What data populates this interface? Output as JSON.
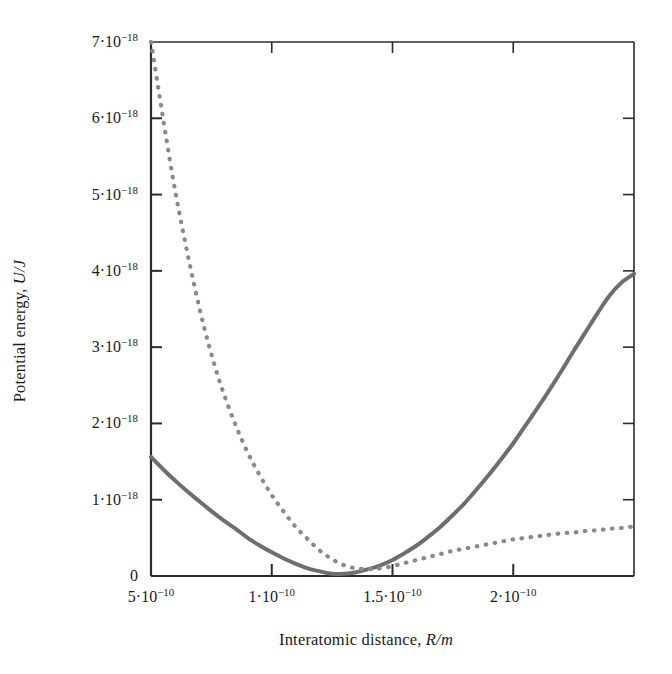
{
  "chart_data": {
    "type": "line",
    "title": "",
    "xlabel": "Interatomic distance, R/m",
    "xlabel_plain": "Interatomic distance,",
    "xlabel_italic": "R/m",
    "ylabel": "Potential energy, U/J",
    "ylabel_plain": "Potential energy,",
    "ylabel_italic": "U/J",
    "xlim": [
      5e-11,
      2.5e-10
    ],
    "ylim": [
      0,
      7e-18
    ],
    "grid": false,
    "legend": "none",
    "x_ticks": [
      {
        "value": 5e-11,
        "mantissa": "5",
        "exponent": "-10",
        "label": "5 · 10⁻¹⁰"
      },
      {
        "value": 1e-10,
        "mantissa": "1",
        "exponent": "-10",
        "label": "1 · 10⁻¹⁰"
      },
      {
        "value": 1.5e-10,
        "mantissa": "1.5",
        "exponent": "-10",
        "label": "1.5 · 10⁻¹⁰"
      },
      {
        "value": 2e-10,
        "mantissa": "2",
        "exponent": "-10",
        "label": "2 · 10⁻¹⁰"
      }
    ],
    "y_ticks": [
      {
        "value": 0,
        "mantissa": "0",
        "exponent": "",
        "label": "0"
      },
      {
        "value": 1e-18,
        "mantissa": "1",
        "exponent": "-18",
        "label": "1 · 10⁻¹⁸"
      },
      {
        "value": 2e-18,
        "mantissa": "2",
        "exponent": "-18",
        "label": "2 · 10⁻¹⁸"
      },
      {
        "value": 3e-18,
        "mantissa": "3",
        "exponent": "-18",
        "label": "3 · 10⁻¹⁸"
      },
      {
        "value": 4e-18,
        "mantissa": "4",
        "exponent": "-18",
        "label": "4 · 10⁻¹⁸"
      },
      {
        "value": 5e-18,
        "mantissa": "5",
        "exponent": "-18",
        "label": "5 · 10⁻¹⁸"
      },
      {
        "value": 6e-18,
        "mantissa": "6",
        "exponent": "-18",
        "label": "6 · 10⁻¹⁸"
      },
      {
        "value": 7e-18,
        "mantissa": "7",
        "exponent": "-18",
        "label": "7 · 10⁻¹⁸"
      }
    ],
    "series": [
      {
        "name": "solid-curve",
        "style": "solid",
        "color": "#6e6e6e",
        "x": [
          0.5,
          0.55,
          0.6,
          0.65,
          0.7,
          0.75,
          0.8,
          0.85,
          0.9,
          0.95,
          1.0,
          1.05,
          1.1,
          1.15,
          1.2,
          1.25,
          1.3,
          1.35,
          1.4,
          1.45,
          1.5,
          1.55,
          1.6,
          1.65,
          1.7,
          1.75,
          1.8,
          1.85,
          1.9,
          1.95,
          2.0,
          2.05,
          2.1,
          2.15,
          2.2,
          2.25,
          2.3,
          2.35,
          2.4,
          2.45,
          2.5
        ],
        "x_unit": "1e-10 m",
        "y": [
          1.56,
          1.4,
          1.25,
          1.11,
          0.98,
          0.85,
          0.73,
          0.62,
          0.5,
          0.4,
          0.31,
          0.23,
          0.16,
          0.1,
          0.06,
          0.03,
          0.03,
          0.05,
          0.09,
          0.14,
          0.21,
          0.3,
          0.4,
          0.52,
          0.65,
          0.8,
          0.96,
          1.14,
          1.33,
          1.53,
          1.74,
          1.97,
          2.2,
          2.44,
          2.69,
          2.95,
          3.2,
          3.45,
          3.68,
          3.85,
          3.96
        ],
        "y_unit": "1e-18 J"
      },
      {
        "name": "dotted-curve",
        "style": "dotted",
        "color": "#8a8a8a",
        "x": [
          0.5,
          0.53,
          0.56,
          0.6,
          0.64,
          0.68,
          0.72,
          0.76,
          0.8,
          0.85,
          0.9,
          0.95,
          1.0,
          1.05,
          1.1,
          1.15,
          1.2,
          1.25,
          1.3,
          1.35,
          1.4,
          1.45,
          1.5,
          1.55,
          1.6,
          1.65,
          1.7,
          1.75,
          1.8,
          1.85,
          1.9,
          1.95,
          2.0,
          2.05,
          2.1,
          2.15,
          2.2,
          2.25,
          2.3,
          2.35,
          2.4,
          2.45,
          2.5
        ],
        "x_unit": "1e-10 m",
        "y": [
          7.0,
          6.4,
          5.8,
          5.05,
          4.4,
          3.8,
          3.26,
          2.8,
          2.4,
          1.98,
          1.62,
          1.32,
          1.06,
          0.84,
          0.64,
          0.48,
          0.33,
          0.22,
          0.14,
          0.1,
          0.09,
          0.1,
          0.13,
          0.17,
          0.21,
          0.25,
          0.29,
          0.33,
          0.36,
          0.39,
          0.42,
          0.45,
          0.48,
          0.5,
          0.52,
          0.54,
          0.56,
          0.57,
          0.59,
          0.6,
          0.62,
          0.63,
          0.65
        ],
        "y_unit": "1e-18 J"
      }
    ],
    "geometry": {
      "plot_left": 151,
      "plot_right": 634,
      "plot_top": 42,
      "plot_bottom": 576
    },
    "colors": {
      "axis": "#2b2b2b",
      "solid_curve": "#6e6e6e",
      "dotted_curve": "#8a8a8a",
      "background": "#ffffff",
      "text": "#1a1a1a"
    }
  }
}
